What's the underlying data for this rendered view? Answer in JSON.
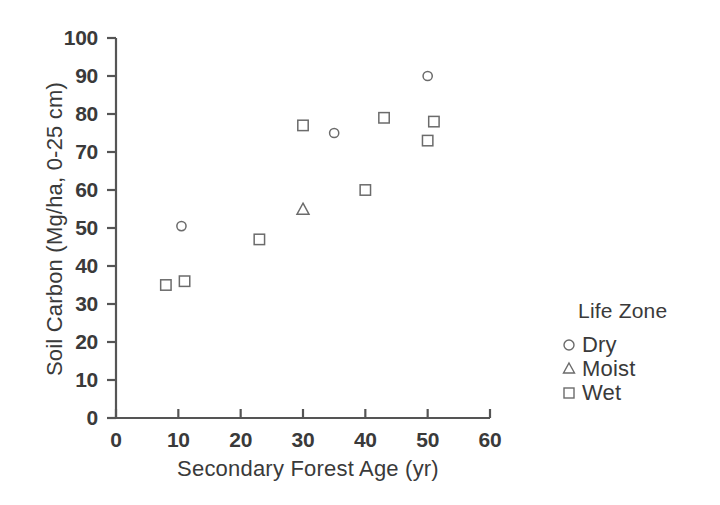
{
  "chart_data": {
    "type": "scatter",
    "title": "",
    "xlabel": "Secondary Forest Age (yr)",
    "ylabel": "Soil Carbon (Mg/ha, 0-25 cm)",
    "xlim": [
      0,
      60
    ],
    "ylim": [
      0,
      100
    ],
    "xticks": [
      0,
      10,
      20,
      30,
      40,
      50,
      60
    ],
    "yticks": [
      0,
      10,
      20,
      30,
      40,
      50,
      60,
      70,
      80,
      90,
      100
    ],
    "grid": false,
    "legend_position": "right",
    "legend_title": "Life Zone",
    "series": [
      {
        "name": "Dry",
        "marker": "circle",
        "color": "#6b6b6b",
        "points": [
          {
            "x": 10.5,
            "y": 50.5
          },
          {
            "x": 35.0,
            "y": 75.0
          },
          {
            "x": 50.0,
            "y": 90.0
          }
        ]
      },
      {
        "name": "Moist",
        "marker": "triangle",
        "color": "#6b6b6b",
        "points": [
          {
            "x": 30.0,
            "y": 55.0
          }
        ]
      },
      {
        "name": "Wet",
        "marker": "square",
        "color": "#6b6b6b",
        "points": [
          {
            "x": 8.0,
            "y": 35.0
          },
          {
            "x": 11.0,
            "y": 36.0
          },
          {
            "x": 23.0,
            "y": 47.0
          },
          {
            "x": 30.0,
            "y": 77.0
          },
          {
            "x": 40.0,
            "y": 60.0
          },
          {
            "x": 43.0,
            "y": 79.0
          },
          {
            "x": 50.0,
            "y": 73.0
          },
          {
            "x": 51.0,
            "y": 78.0
          }
        ]
      }
    ]
  },
  "axes": {
    "x_title": "Secondary Forest Age (yr)",
    "y_title": "Soil Carbon (Mg/ha, 0-25 cm)",
    "x_tick_labels": [
      "0",
      "10",
      "20",
      "30",
      "40",
      "50",
      "60"
    ],
    "y_tick_labels": [
      "0",
      "10",
      "20",
      "30",
      "40",
      "50",
      "60",
      "70",
      "80",
      "90",
      "100"
    ],
    "axis_color": "#555555"
  },
  "legend": {
    "title": "Life Zone",
    "entries": [
      {
        "label": "Dry",
        "marker": "circle-marker"
      },
      {
        "label": "Moist",
        "marker": "triangle-marker"
      },
      {
        "label": "Wet",
        "marker": "square-marker"
      }
    ]
  }
}
